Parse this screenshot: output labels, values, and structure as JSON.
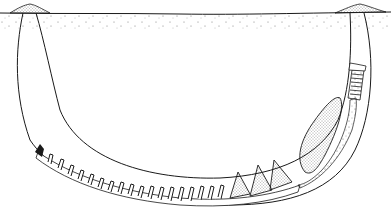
{
  "illustration": {
    "subject": "worm-in-u-shaped-burrow",
    "style": "black ink line drawing with stippling",
    "colors": {
      "background": "#ffffff",
      "ink": "#1a1a1a",
      "stipple": "#555555"
    },
    "elements": [
      {
        "name": "sediment-surface",
        "description": "ground surface line with stippled sediment layer"
      },
      {
        "name": "left-burrow-opening",
        "description": "mound at left entrance"
      },
      {
        "name": "right-burrow-opening",
        "description": "mound at right entrance"
      },
      {
        "name": "u-shaped-burrow",
        "description": "U-shaped tube in sediment"
      },
      {
        "name": "worm-body",
        "description": "segmented worm with parapodia lining bottom of burrow"
      },
      {
        "name": "worm-head",
        "description": "dark head at left end of worm"
      },
      {
        "name": "mucus-bag",
        "description": "stippled elongate bag at right arm of burrow"
      },
      {
        "name": "worm-tail-segments",
        "description": "ringed segments rising up right arm"
      }
    ]
  }
}
